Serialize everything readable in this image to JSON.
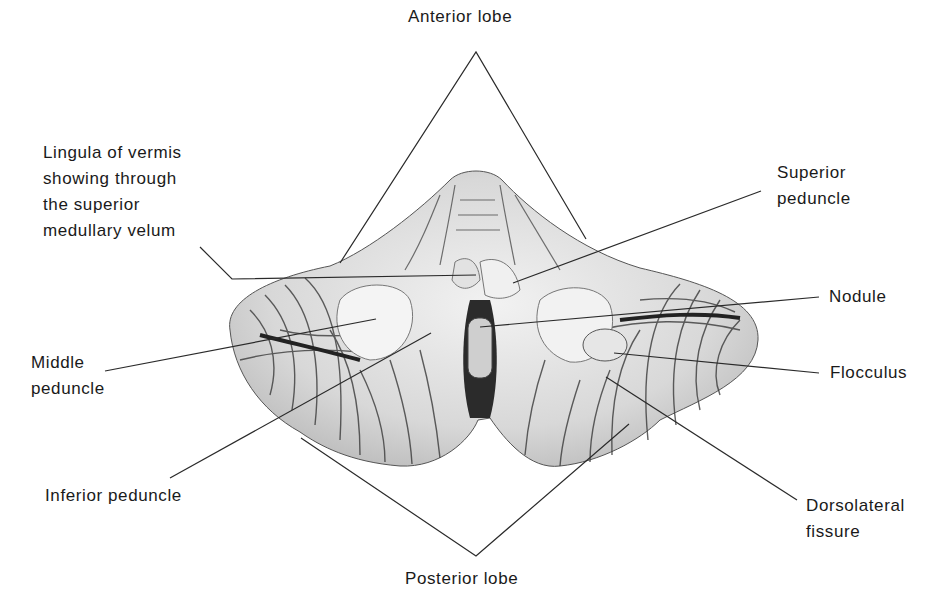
{
  "figure": {
    "labels": [
      {
        "id": "anterior-lobe",
        "text": "Anterior lobe",
        "x": 408,
        "y": 28
      },
      {
        "id": "lingula",
        "text": "Lingula of vermis\nshowing through\nthe superior\nmedullary velum",
        "x": 43,
        "y": 140
      },
      {
        "id": "superior-peduncle",
        "text": "Superior\npeduncle",
        "x": 777,
        "y": 160
      },
      {
        "id": "nodule",
        "text": "Nodule",
        "x": 829,
        "y": 284
      },
      {
        "id": "middle-peduncle",
        "text": "Middle\npeduncle",
        "x": 31,
        "y": 350
      },
      {
        "id": "flocculus",
        "text": "Flocculus",
        "x": 830,
        "y": 360
      },
      {
        "id": "inferior-peduncle",
        "text": "Inferior peduncle",
        "x": 45,
        "y": 483
      },
      {
        "id": "dorsolateral-fissure",
        "text": "Dorsolateral\nfissure",
        "x": 806,
        "y": 493
      },
      {
        "id": "posterior-lobe",
        "text": "Posterior lobe",
        "x": 405,
        "y": 571
      }
    ],
    "leader_lines": [
      {
        "for": "anterior-lobe",
        "points": [
          [
            340,
            263
          ],
          [
            476,
            52
          ],
          [
            586,
            239
          ]
        ]
      },
      {
        "for": "lingula",
        "points": [
          [
            200,
            247
          ],
          [
            232,
            279
          ],
          [
            476,
            275
          ]
        ]
      },
      {
        "for": "superior-peduncle",
        "points": [
          [
            761,
            191
          ],
          [
            513,
            283
          ]
        ]
      },
      {
        "for": "nodule",
        "points": [
          [
            819,
            297
          ],
          [
            480,
            327
          ]
        ]
      },
      {
        "for": "middle-peduncle",
        "points": [
          [
            105,
            371
          ],
          [
            376,
            319
          ]
        ]
      },
      {
        "for": "flocculus",
        "points": [
          [
            819,
            373
          ],
          [
            614,
            353
          ]
        ]
      },
      {
        "for": "inferior-peduncle",
        "points": [
          [
            170,
            478
          ],
          [
            431,
            333
          ]
        ]
      },
      {
        "for": "dorsolateral-fissure",
        "points": [
          [
            797,
            500
          ],
          [
            606,
            377
          ]
        ]
      },
      {
        "for": "posterior-lobe",
        "points": [
          [
            301,
            438
          ],
          [
            476,
            556
          ],
          [
            629,
            424
          ]
        ]
      }
    ],
    "colors": {
      "text": "#1a1a1a",
      "line": "#2a2a2a",
      "tissue_light": "#e8e8e8",
      "tissue_dark": "#2b2b2b"
    }
  }
}
